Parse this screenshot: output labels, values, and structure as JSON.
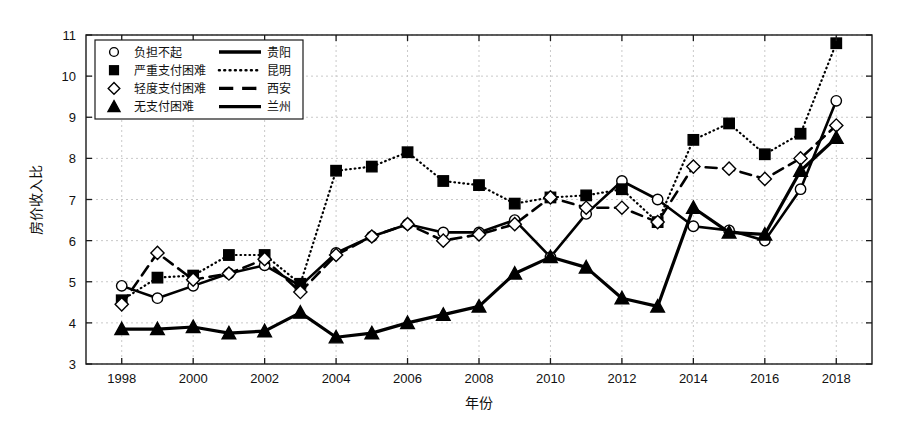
{
  "chart_data": {
    "type": "line",
    "title": "",
    "xlabel": "年份",
    "ylabel": "房价收入比",
    "xlim": [
      1997,
      2019
    ],
    "ylim": [
      3,
      11
    ],
    "ytick_values": [
      3,
      4,
      5,
      6,
      7,
      8,
      9,
      10,
      11
    ],
    "xtick_values": [
      1998,
      2000,
      2002,
      2004,
      2006,
      2008,
      2010,
      2012,
      2014,
      2016,
      2018
    ],
    "xtick_labels": [
      "1998",
      "2000",
      "2002",
      "2004",
      "2006",
      "2008",
      "2010",
      "2012",
      "2014",
      "2016",
      "2018"
    ],
    "ytick_labels": [
      "3",
      "4",
      "5",
      "6",
      "7",
      "8",
      "9",
      "10",
      "11"
    ],
    "grid": true,
    "legend_position": "upper-left",
    "x": [
      1998,
      1999,
      2000,
      2001,
      2002,
      2003,
      2004,
      2005,
      2006,
      2007,
      2008,
      2009,
      2010,
      2011,
      2012,
      2013,
      2014,
      2015,
      2016,
      2017,
      2018
    ],
    "series": [
      {
        "name": "贵阳",
        "marker": "circle",
        "linestyle": "solid",
        "linewidth": 2.6,
        "values": [
          4.9,
          4.6,
          4.9,
          5.2,
          5.4,
          4.9,
          5.7,
          6.1,
          6.4,
          6.2,
          6.2,
          6.5,
          5.6,
          6.65,
          7.45,
          7.0,
          6.35,
          6.25,
          6.0,
          7.25,
          9.4
        ]
      },
      {
        "name": "昆明",
        "marker": "square",
        "linestyle": "dotted",
        "linewidth": 2.2,
        "values": [
          4.55,
          5.1,
          5.15,
          5.65,
          5.65,
          4.95,
          7.7,
          7.8,
          8.15,
          7.45,
          7.35,
          6.9,
          7.05,
          7.1,
          7.25,
          6.45,
          8.45,
          8.85,
          8.1,
          8.6,
          10.8
        ]
      },
      {
        "name": "西安",
        "marker": "diamond",
        "linestyle": "dashed",
        "linewidth": 2.6,
        "values": [
          4.45,
          5.7,
          5.05,
          5.2,
          5.55,
          4.75,
          5.65,
          6.1,
          6.4,
          6.0,
          6.15,
          6.4,
          7.05,
          6.8,
          6.8,
          6.45,
          7.8,
          7.75,
          7.5,
          8.0,
          8.8
        ]
      },
      {
        "name": "兰州",
        "marker": "triangle",
        "linestyle": "solid",
        "linewidth": 3.2,
        "values": [
          3.85,
          3.85,
          3.9,
          3.75,
          3.8,
          4.25,
          3.65,
          3.75,
          4.0,
          4.2,
          4.4,
          5.2,
          5.6,
          5.35,
          4.6,
          4.4,
          6.8,
          6.2,
          6.15,
          7.7,
          8.5
        ]
      }
    ]
  },
  "legend": {
    "entries": [
      {
        "marker_label": "负担不起",
        "marker": "circle",
        "line_label": "贵阳",
        "linestyle": "solid"
      },
      {
        "marker_label": "严重支付困难",
        "marker": "square",
        "line_label": "昆明",
        "linestyle": "dotted"
      },
      {
        "marker_label": "轻度支付困难",
        "marker": "diamond",
        "line_label": "西安",
        "linestyle": "dashed"
      },
      {
        "marker_label": "无支付困难",
        "marker": "triangle",
        "line_label": "兰州",
        "linestyle": "solid"
      }
    ]
  },
  "colors": {
    "line": "#000000",
    "grid": "#c9c9c9",
    "frame": "#1a1a1a",
    "background": "#ffffff"
  }
}
